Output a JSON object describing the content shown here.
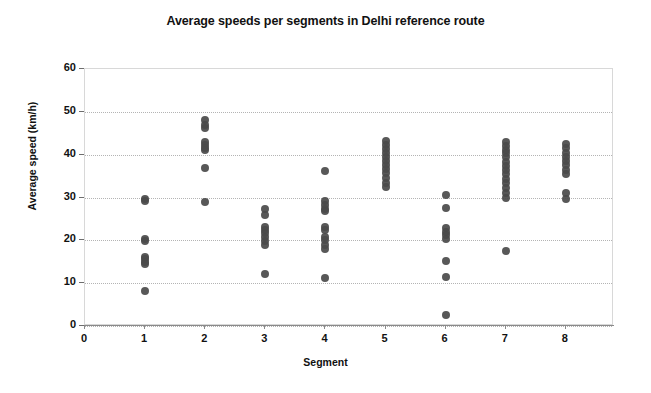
{
  "chart_data": {
    "type": "scatter",
    "title": "Average speeds per segments in Delhi reference route",
    "xlabel": "Segment",
    "ylabel": "Average speed (km/h)",
    "xlim": [
      0,
      8.8
    ],
    "ylim": [
      0,
      60
    ],
    "xticks": [
      0,
      1,
      2,
      3,
      4,
      5,
      6,
      7,
      8
    ],
    "yticks": [
      0,
      10,
      20,
      30,
      40,
      50,
      60
    ],
    "grid": "horizontal-dotted",
    "legend": "none",
    "marker_color": "#4a4a4a",
    "series": [
      {
        "name": "Segment 1",
        "x": 1,
        "values": [
          29.6,
          29.2,
          20.3,
          19.9,
          16.2,
          15.6,
          15.0,
          14.4,
          8.2
        ]
      },
      {
        "name": "Segment 2",
        "x": 2,
        "values": [
          48.0,
          47.0,
          46.3,
          43.0,
          42.2,
          41.5,
          41.0,
          36.8,
          29.0
        ]
      },
      {
        "name": "Segment 3",
        "x": 3,
        "values": [
          27.2,
          26.0,
          23.2,
          22.4,
          21.6,
          20.8,
          19.8,
          18.8,
          12.1
        ]
      },
      {
        "name": "Segment 4",
        "x": 4,
        "values": [
          36.1,
          29.2,
          28.3,
          27.4,
          26.8,
          23.2,
          22.4,
          20.8,
          20.0,
          18.8,
          18.0,
          11.1
        ]
      },
      {
        "name": "Segment 5",
        "x": 5,
        "values": [
          43.2,
          42.2,
          41.3,
          40.4,
          39.4,
          38.5,
          37.6,
          36.7,
          35.8,
          34.6,
          33.3,
          32.4
        ]
      },
      {
        "name": "Segment 6",
        "x": 6,
        "values": [
          30.6,
          27.5,
          22.8,
          22.0,
          21.2,
          20.4,
          15.1,
          11.5,
          2.6
        ]
      },
      {
        "name": "Segment 7",
        "x": 7,
        "values": [
          43.0,
          42.0,
          41.2,
          40.3,
          39.4,
          38.4,
          37.4,
          36.4,
          35.4,
          34.4,
          33.3,
          32.2,
          31.0,
          29.9,
          17.6
        ]
      },
      {
        "name": "Segment 8",
        "x": 8,
        "values": [
          42.5,
          41.5,
          40.5,
          39.5,
          38.5,
          37.5,
          36.5,
          35.4,
          31.0,
          29.7
        ]
      }
    ]
  }
}
